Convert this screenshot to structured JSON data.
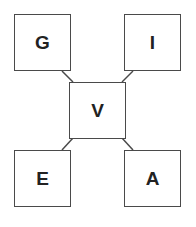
{
  "diagram": {
    "nodes": [
      {
        "id": "G",
        "label": "G",
        "position": "top-left"
      },
      {
        "id": "I",
        "label": "I",
        "position": "top-right"
      },
      {
        "id": "V",
        "label": "V",
        "position": "center"
      },
      {
        "id": "E",
        "label": "E",
        "position": "bottom-left"
      },
      {
        "id": "A",
        "label": "A",
        "position": "bottom-right"
      }
    ],
    "edges": [
      {
        "from": "G",
        "to": "V"
      },
      {
        "from": "I",
        "to": "V"
      },
      {
        "from": "E",
        "to": "V"
      },
      {
        "from": "A",
        "to": "V"
      }
    ],
    "colors": {
      "stroke": "#4a4a4a",
      "text": "#222222",
      "background": "#ffffff"
    }
  }
}
